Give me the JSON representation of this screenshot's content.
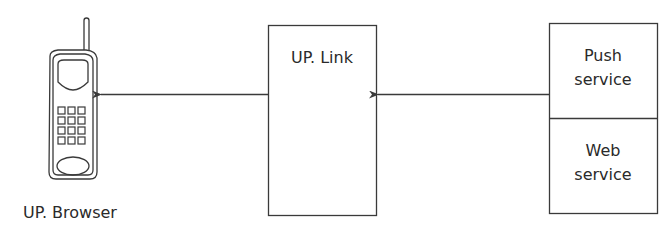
{
  "diagram": {
    "nodes": {
      "browser": {
        "label": "UP. Browser",
        "icon": "mobile-phone-icon"
      },
      "link": {
        "label": "UP. Link"
      },
      "push": {
        "label_line1": "Push",
        "label_line2": "service"
      },
      "web": {
        "label_line1": "Web",
        "label_line2": "service"
      }
    },
    "edges": [
      {
        "from": "push",
        "to": "link"
      },
      {
        "from": "link",
        "to": "browser"
      }
    ],
    "colors": {
      "stroke": "#3a3a3a",
      "background": "#ffffff",
      "text": "#2a2a2a"
    }
  }
}
